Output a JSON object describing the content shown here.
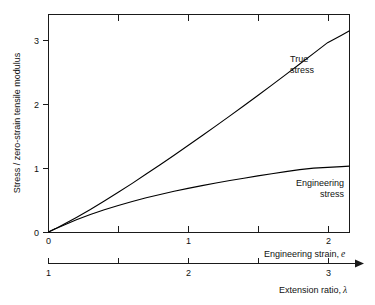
{
  "chart_data": {
    "type": "line",
    "title": "",
    "subtitle": "",
    "ylabel": "Stress / zero-strain tensile modulus",
    "xlabel": "Engineering strain, e",
    "xlabel_main": "Engineering strain,",
    "xlabel_symbol": "e",
    "secondary_xlabel": "Extension ratio, λ",
    "secondary_xlabel_main": "Extension ratio,",
    "secondary_xlabel_symbol": "λ",
    "grid": false,
    "legend_position": "inline-annotations",
    "xlim": [
      0,
      2.157
    ],
    "ylim": [
      0,
      3.406
    ],
    "xticks": [
      0,
      0.5,
      1,
      1.5,
      2
    ],
    "xtick_labels": [
      "0",
      "",
      "1",
      "",
      "2"
    ],
    "yticks": [
      0,
      1,
      2,
      3
    ],
    "ytick_labels": [
      "0",
      "1",
      "2",
      "3"
    ],
    "secondary_xticks": [
      1,
      1.5,
      2,
      2.5,
      3
    ],
    "secondary_xtick_labels": [
      "1",
      "",
      "2",
      "",
      "3"
    ],
    "secondary_axis_has_arrow": true,
    "colors": {
      "axis": "#1a1a1a",
      "curve": "#000000",
      "background": "#ffffff",
      "text": "#111111"
    },
    "series": [
      {
        "name": "True stress",
        "label_line1": "True",
        "label_line2": "stress",
        "x": [
          0,
          0.05,
          0.1,
          0.15,
          0.2,
          0.3,
          0.4,
          0.5,
          0.6,
          0.7,
          0.8,
          0.9,
          1.0,
          1.1,
          1.2,
          1.3,
          1.4,
          1.5,
          1.6,
          1.7,
          1.8,
          1.9,
          2.0,
          2.1,
          2.157
        ],
        "values": [
          0,
          0.053,
          0.109,
          0.167,
          0.227,
          0.352,
          0.484,
          0.621,
          0.762,
          0.907,
          1.054,
          1.203,
          1.354,
          1.507,
          1.662,
          1.818,
          1.977,
          2.137,
          2.3,
          2.464,
          2.63,
          2.797,
          2.965,
          3.082,
          3.152
        ]
      },
      {
        "name": "Engineering stress",
        "label_line1": "Engineering",
        "label_line2": "stress",
        "x": [
          0,
          0.05,
          0.1,
          0.15,
          0.2,
          0.3,
          0.4,
          0.5,
          0.6,
          0.7,
          0.8,
          0.9,
          1.0,
          1.1,
          1.2,
          1.3,
          1.4,
          1.5,
          1.6,
          1.7,
          1.8,
          1.9,
          2.0,
          2.1,
          2.157
        ],
        "values": [
          0,
          0.05,
          0.099,
          0.146,
          0.191,
          0.274,
          0.348,
          0.416,
          0.478,
          0.535,
          0.588,
          0.637,
          0.683,
          0.726,
          0.767,
          0.806,
          0.843,
          0.879,
          0.913,
          0.946,
          0.977,
          1.0,
          1.012,
          1.024,
          1.031
        ]
      }
    ]
  }
}
